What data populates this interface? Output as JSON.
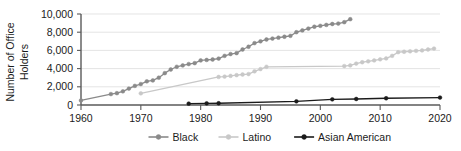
{
  "chart_data": {
    "type": "line",
    "title": "",
    "xlabel": "",
    "ylabel": "Number of Office Holders",
    "ylabel_line1": "Number of Office",
    "ylabel_line2": "Holders",
    "xlim": [
      1960,
      2020
    ],
    "ylim": [
      0,
      10000
    ],
    "grid": true,
    "legend_position": "bottom",
    "xticks": [
      1960,
      1970,
      1980,
      1990,
      2000,
      2010,
      2020
    ],
    "xtick_labels": [
      "1960",
      "1970",
      "1980",
      "1990",
      "2000",
      "2010",
      "2020"
    ],
    "yticks": [
      0,
      2000,
      4000,
      6000,
      8000,
      10000
    ],
    "ytick_labels": [
      "0",
      "2,000",
      "4,000",
      "6,000",
      "8,000",
      "10,000"
    ],
    "series": [
      {
        "name": "Black",
        "color": "#8a8a8a",
        "marker_color": "#8a8a8a",
        "x": [
          1960,
          1965,
          1966,
          1967,
          1968,
          1969,
          1970,
          1971,
          1972,
          1973,
          1974,
          1975,
          1976,
          1977,
          1978,
          1979,
          1980,
          1981,
          1982,
          1983,
          1984,
          1985,
          1986,
          1987,
          1988,
          1989,
          1990,
          1991,
          1992,
          1993,
          1994,
          1995,
          1996,
          1997,
          1998,
          1999,
          2000,
          2001,
          2002,
          2003,
          2004,
          2005
        ],
        "values": [
          500,
          1200,
          1300,
          1500,
          1800,
          2100,
          2300,
          2600,
          2700,
          3000,
          3500,
          3900,
          4200,
          4350,
          4500,
          4600,
          4900,
          4950,
          5000,
          5100,
          5400,
          5600,
          5700,
          6100,
          6400,
          6800,
          7000,
          7200,
          7300,
          7400,
          7500,
          7600,
          8000,
          8200,
          8400,
          8600,
          8700,
          8800,
          8900,
          8950,
          9100,
          9430
        ]
      },
      {
        "name": "Latino",
        "color": "#c8c8c8",
        "marker_color": "#c8c8c8",
        "x": [
          1970,
          1983,
          1984,
          1985,
          1986,
          1987,
          1988,
          1989,
          1990,
          1991,
          2004,
          2005,
          2006,
          2007,
          2008,
          2009,
          2010,
          2011,
          2012,
          2013,
          2014,
          2015,
          2016,
          2017,
          2018,
          2019
        ],
        "values": [
          1280,
          3080,
          3120,
          3200,
          3280,
          3350,
          3400,
          3700,
          3950,
          4200,
          4280,
          4350,
          4550,
          4700,
          4800,
          4900,
          5020,
          5120,
          5400,
          5800,
          5850,
          5900,
          5950,
          6000,
          6100,
          6200
        ]
      },
      {
        "name": "Asian American",
        "color": "#1b1b1b",
        "marker_color": "#1b1b1b",
        "x": [
          1978,
          1981,
          1983,
          1996,
          2002,
          2006,
          2011,
          2020
        ],
        "values": [
          150,
          180,
          190,
          400,
          620,
          660,
          740,
          820
        ]
      }
    ]
  },
  "legend": {
    "items": [
      {
        "label": "Black",
        "color": "#8a8a8a"
      },
      {
        "label": "Latino",
        "color": "#c8c8c8"
      },
      {
        "label": "Asian American",
        "color": "#1b1b1b"
      }
    ]
  }
}
